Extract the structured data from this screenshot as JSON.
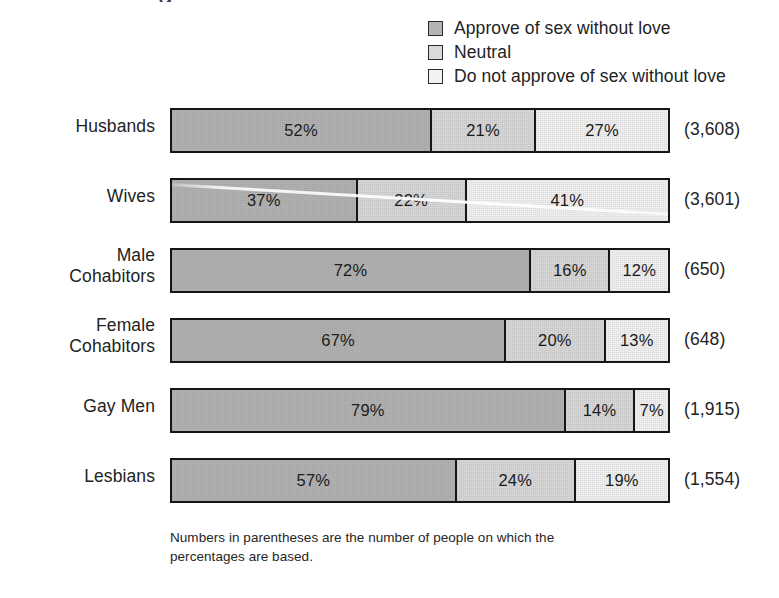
{
  "artifact": {
    "clipped_title_descender": "g"
  },
  "footnote": "Numbers in parentheses are the number of people on which the percentages are based.",
  "legend": {
    "items": [
      {
        "label": "Approve of sex without love",
        "color": "#b4b4b4",
        "swatch_name": "legend-swatch-approve"
      },
      {
        "label": "Neutral",
        "color": "#d9d9d9",
        "swatch_name": "legend-swatch-neutral"
      },
      {
        "label": "Do not approve of sex without love",
        "color": "#f2f2f2",
        "swatch_name": "legend-swatch-disapprove"
      }
    ]
  },
  "chart_data": {
    "type": "bar",
    "orientation": "horizontal",
    "stacked": true,
    "stack_total": 100,
    "title": "",
    "xlabel": "",
    "ylabel": "",
    "xlim": [
      0,
      100
    ],
    "grid": false,
    "legend_position": "top-right",
    "value_suffix": "%",
    "categories": [
      "Husbands",
      "Wives",
      "Male Cohabitors",
      "Female Cohabitors",
      "Gay Men",
      "Lesbians"
    ],
    "category_counts": [
      "(3,608)",
      "(3,601)",
      "(650)",
      "(648)",
      "(1,915)",
      "(1,554)"
    ],
    "series": [
      {
        "name": "Approve of sex without love",
        "color": "#b4b4b4",
        "values": [
          52,
          37,
          72,
          67,
          79,
          57
        ]
      },
      {
        "name": "Neutral",
        "color": "#d9d9d9",
        "values": [
          21,
          22,
          16,
          20,
          14,
          24
        ]
      },
      {
        "name": "Do not approve of sex without love",
        "color": "#f2f2f2",
        "values": [
          27,
          41,
          12,
          13,
          7,
          19
        ]
      }
    ],
    "annotations": [
      "Numbers in parentheses are the number of people on which the percentages are based."
    ]
  },
  "rows": [
    {
      "label_line1": "Husbands",
      "label_line2": "",
      "two_line": false,
      "count": "(3,608)",
      "segments": [
        {
          "value": "52%",
          "pct": 52,
          "color": "#b4b4b4"
        },
        {
          "value": "21%",
          "pct": 21,
          "color": "#d9d9d9"
        },
        {
          "value": "27%",
          "pct": 27,
          "color": "#f2f2f2"
        }
      ]
    },
    {
      "label_line1": "Wives",
      "label_line2": "",
      "two_line": false,
      "count": "(3,601)",
      "segments": [
        {
          "value": "37%",
          "pct": 37,
          "color": "#b4b4b4"
        },
        {
          "value": "22%",
          "pct": 22,
          "color": "#d9d9d9"
        },
        {
          "value": "41%",
          "pct": 41,
          "color": "#f2f2f2"
        }
      ]
    },
    {
      "label_line1": "Male",
      "label_line2": "Cohabitors",
      "two_line": true,
      "count": "(650)",
      "segments": [
        {
          "value": "72%",
          "pct": 72,
          "color": "#b4b4b4"
        },
        {
          "value": "16%",
          "pct": 16,
          "color": "#d9d9d9"
        },
        {
          "value": "12%",
          "pct": 12,
          "color": "#f2f2f2"
        }
      ]
    },
    {
      "label_line1": "Female",
      "label_line2": "Cohabitors",
      "two_line": true,
      "count": "(648)",
      "segments": [
        {
          "value": "67%",
          "pct": 67,
          "color": "#b4b4b4"
        },
        {
          "value": "20%",
          "pct": 20,
          "color": "#d9d9d9"
        },
        {
          "value": "13%",
          "pct": 13,
          "color": "#f2f2f2"
        }
      ]
    },
    {
      "label_line1": "Gay Men",
      "label_line2": "",
      "two_line": false,
      "count": "(1,915)",
      "segments": [
        {
          "value": "79%",
          "pct": 79,
          "color": "#b4b4b4"
        },
        {
          "value": "14%",
          "pct": 14,
          "color": "#d9d9d9"
        },
        {
          "value": "7%",
          "pct": 7,
          "color": "#f2f2f2"
        }
      ]
    },
    {
      "label_line1": "Lesbians",
      "label_line2": "",
      "two_line": false,
      "count": "(1,554)",
      "segments": [
        {
          "value": "57%",
          "pct": 57,
          "color": "#b4b4b4"
        },
        {
          "value": "24%",
          "pct": 24,
          "color": "#d9d9d9"
        },
        {
          "value": "19%",
          "pct": 19,
          "color": "#f2f2f2"
        }
      ]
    }
  ]
}
